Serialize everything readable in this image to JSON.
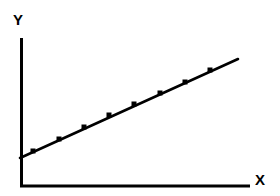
{
  "figure": {
    "background_color": "#ffffff",
    "ink_color": "#000000",
    "width": 280,
    "height": 196
  },
  "axes": {
    "x_axis": {
      "label": "X",
      "label_name": "x-axis-label",
      "start_px": [
        20,
        187
      ],
      "end_px": [
        250,
        187
      ],
      "line_width_px": 3,
      "ticks": [],
      "tick_labels": []
    },
    "y_axis": {
      "label": "Y",
      "label_name": "y-axis-label",
      "start_px": [
        20,
        187
      ],
      "end_px": [
        20,
        38
      ],
      "line_width_px": 3,
      "ticks": [],
      "tick_labels": []
    }
  },
  "chart_data": {
    "type": "line",
    "title": "",
    "subtitle": "",
    "xlabel": "X",
    "ylabel": "Y",
    "grid": false,
    "legend": null,
    "legend_position": "none",
    "annotations": [],
    "xlim": [
      0,
      10
    ],
    "ylim": [
      0,
      10
    ],
    "xticks": [],
    "yticks": [],
    "xtick_labels": [],
    "ytick_labels": [],
    "series": [
      {
        "name": "linear-trend",
        "color": "#000000",
        "line_width_px": 2.6,
        "marker": "square",
        "marker_size_px": 5,
        "line_start": {
          "x": 0.0,
          "y": 1.93
        },
        "line_end": {
          "x": 9.48,
          "y": 8.54
        },
        "x": [
          0.57,
          1.7,
          2.78,
          3.87,
          4.96,
          6.09,
          7.17,
          8.26
        ],
        "y": [
          2.39,
          3.21,
          4.03,
          4.85,
          5.6,
          6.36,
          7.11,
          7.93
        ],
        "points_px": [
          {
            "x": 33,
            "y": 151
          },
          {
            "x": 59,
            "y": 139
          },
          {
            "x": 84,
            "y": 127
          },
          {
            "x": 109,
            "y": 115
          },
          {
            "x": 134,
            "y": 104
          },
          {
            "x": 160,
            "y": 93
          },
          {
            "x": 185,
            "y": 82
          },
          {
            "x": 210,
            "y": 70
          }
        ],
        "line_px": {
          "x1": 20,
          "y1": 158,
          "x2": 238,
          "y2": 59
        }
      }
    ]
  }
}
